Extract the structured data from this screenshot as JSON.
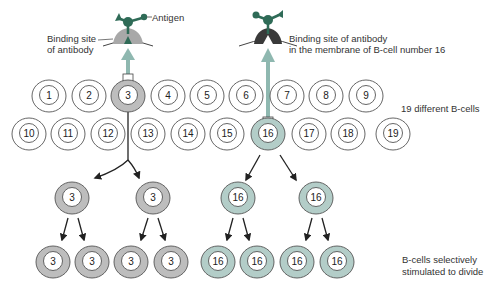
{
  "labels": {
    "antigen": "Antigen",
    "binding_site_left_1": "Binding site",
    "binding_site_left_2": "of antibody",
    "binding_site_right_1": "Binding site of antibody",
    "binding_site_right_2": "in the membrane of B-cell number 16",
    "different_b_cells": "19 different B-cells",
    "selectively_1": "B-cells selectively",
    "selectively_2": "stimulated to divide"
  },
  "colors": {
    "cell_outline": "#555555",
    "grey_cell_fill": "#bdbdbd",
    "teal_cell_fill": "#b3cdc8",
    "antigen_green": "#2f6b57",
    "arrow_teal": "#8fb8b0",
    "receptor_dark": "#3a3a3a",
    "receptor_grey": "#a8a8a8"
  },
  "row1_cells": [
    {
      "n": "1",
      "x": 49,
      "type": "plain"
    },
    {
      "n": "2",
      "x": 89,
      "type": "plain"
    },
    {
      "n": "3",
      "x": 128,
      "type": "grey"
    },
    {
      "n": "4",
      "x": 168,
      "type": "plain"
    },
    {
      "n": "5",
      "x": 207,
      "type": "plain"
    },
    {
      "n": "6",
      "x": 246,
      "type": "plain"
    },
    {
      "n": "7",
      "x": 287,
      "type": "plain"
    },
    {
      "n": "8",
      "x": 326,
      "type": "plain"
    },
    {
      "n": "9",
      "x": 366,
      "type": "plain"
    }
  ],
  "row2_cells": [
    {
      "n": "10",
      "x": 29,
      "type": "plain"
    },
    {
      "n": "11",
      "x": 68,
      "type": "plain"
    },
    {
      "n": "12",
      "x": 108,
      "type": "plain"
    },
    {
      "n": "13",
      "x": 148,
      "type": "plain"
    },
    {
      "n": "14",
      "x": 188,
      "type": "plain"
    },
    {
      "n": "15",
      "x": 227,
      "type": "plain"
    },
    {
      "n": "16",
      "x": 268,
      "type": "teal"
    },
    {
      "n": "17",
      "x": 309,
      "type": "plain"
    },
    {
      "n": "18",
      "x": 348,
      "type": "plain"
    },
    {
      "n": "19",
      "x": 393,
      "type": "plain"
    }
  ],
  "gen1_cells": [
    {
      "n": "3",
      "x": 72,
      "type": "grey"
    },
    {
      "n": "3",
      "x": 153,
      "type": "grey"
    },
    {
      "n": "16",
      "x": 238,
      "type": "teal"
    },
    {
      "n": "16",
      "x": 316,
      "type": "teal"
    }
  ],
  "gen2_cells": [
    {
      "n": "3",
      "x": 53,
      "type": "grey"
    },
    {
      "n": "3",
      "x": 92,
      "type": "grey"
    },
    {
      "n": "3",
      "x": 131,
      "type": "grey"
    },
    {
      "n": "3",
      "x": 171,
      "type": "grey"
    },
    {
      "n": "16",
      "x": 218,
      "type": "teal"
    },
    {
      "n": "16",
      "x": 257,
      "type": "teal"
    },
    {
      "n": "16",
      "x": 297,
      "type": "teal"
    },
    {
      "n": "16",
      "x": 337,
      "type": "teal"
    }
  ]
}
